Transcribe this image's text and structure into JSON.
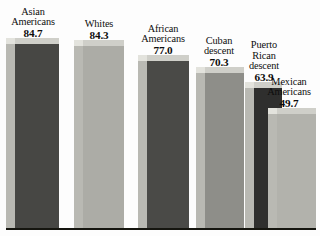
{
  "chart_data": {
    "type": "bar",
    "title": "",
    "subtitle": "",
    "xlabel": "",
    "ylabel": "",
    "ylim": [
      0,
      100
    ],
    "grid": false,
    "legend": "none",
    "categories": [
      "Asian Americans",
      "Whites",
      "African Americans",
      "Cuban descent",
      "Puerto Rican descent",
      "Mexican Americans"
    ],
    "values": [
      84.7,
      84.3,
      77.0,
      70.3,
      63.9,
      49.7
    ],
    "value_labels": [
      "84.7",
      "84.3",
      "77.0",
      "70.3",
      "63.9",
      "49.7"
    ],
    "bars": [
      {
        "label_lines": [
          "Asian",
          "Americans"
        ],
        "value": 84.7,
        "value_label": "84.7",
        "color": "#474744",
        "left": 6,
        "width": 53,
        "height": 190,
        "label_left": 0,
        "label_width": 66,
        "label_bottom": 197
      },
      {
        "label_lines": [
          "Whites"
        ],
        "value": 84.3,
        "value_label": "84.3",
        "color": "#acaca6",
        "left": 74,
        "width": 50,
        "height": 188,
        "label_left": 70,
        "label_width": 58,
        "label_bottom": 195
      },
      {
        "label_lines": [
          "African",
          "Americans"
        ],
        "value": 77.0,
        "value_label": "77.0",
        "color": "#4a4a47",
        "left": 138,
        "width": 51,
        "height": 173,
        "label_left": 130,
        "label_width": 66,
        "label_bottom": 180
      },
      {
        "label_lines": [
          "Cuban",
          "descent"
        ],
        "value": 70.3,
        "value_label": "70.3",
        "color": "#8e8e89",
        "left": 196,
        "width": 48,
        "height": 161,
        "label_left": 188,
        "label_width": 62,
        "label_bottom": 168
      },
      {
        "label_lines": [
          "Puerto",
          "Rican",
          "descent"
        ],
        "value": 63.9,
        "value_label": "63.9",
        "color": "#2f2f2e",
        "left": 245,
        "width": 37,
        "height": 146,
        "label_left": 236,
        "label_width": 56,
        "label_bottom": 153
      },
      {
        "label_lines": [
          "Mexican",
          "Americans"
        ],
        "value": 49.7,
        "value_label": "49.7",
        "color": "#b2b2ac",
        "left": 268,
        "width": 48,
        "height": 120,
        "label_left": 258,
        "label_width": 62,
        "label_bottom": 127
      }
    ]
  }
}
